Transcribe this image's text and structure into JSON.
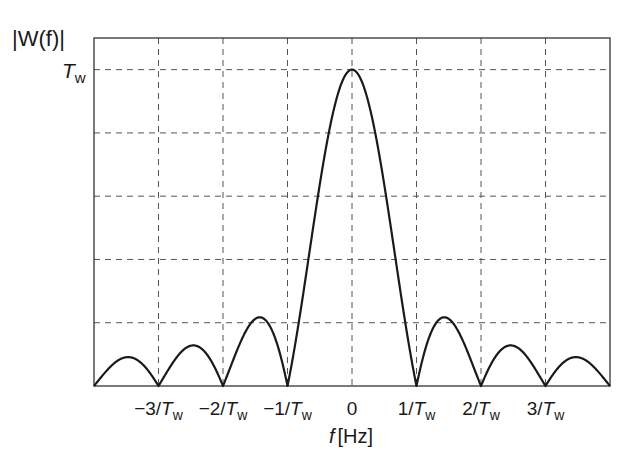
{
  "chart_data": {
    "type": "line",
    "title": "",
    "ylabel": "|W(f)|",
    "xlabel": "f [Hz]",
    "xlabel_var": "f",
    "xlabel_unit": "[Hz]",
    "x_unit": "1/T_w",
    "xlim": [
      -4,
      4
    ],
    "ylim": [
      0,
      1.1
    ],
    "y_unit": "T_w",
    "grid": true,
    "grid_style": "dashed",
    "x_ticks": [
      -3,
      -2,
      -1,
      0,
      1,
      2,
      3
    ],
    "x_tick_labels": [
      {
        "num": "−3/",
        "var": "T",
        "sub": "w"
      },
      {
        "num": "−2/",
        "var": "T",
        "sub": "w"
      },
      {
        "num": "−1/",
        "var": "T",
        "sub": "w"
      },
      {
        "num": "0",
        "var": "",
        "sub": ""
      },
      {
        "num": "1/",
        "var": "T",
        "sub": "w"
      },
      {
        "num": "2/",
        "var": "T",
        "sub": "w"
      },
      {
        "num": "3/",
        "var": "T",
        "sub": "w"
      }
    ],
    "y_ticks": [
      0.2,
      0.4,
      0.6,
      0.8,
      1.0
    ],
    "y_tick_labels": [
      {
        "value": 1.0,
        "var": "T",
        "sub": "w"
      }
    ],
    "series": [
      {
        "name": "|W(f)| = T_w |sinc(f T_w)|",
        "function": "abs_sinc",
        "peak": 1.0,
        "zeros": [
          -3,
          -2,
          -1,
          1,
          2,
          3
        ],
        "x": [
          -4,
          -3.5,
          -3,
          -2.5,
          -2,
          -1.5,
          -1,
          -0.5,
          0,
          0.5,
          1,
          1.5,
          2,
          2.5,
          3,
          3.5,
          4
        ],
        "values": [
          0,
          0.091,
          0,
          0.127,
          0,
          0.212,
          0,
          0.637,
          1.0,
          0.637,
          0,
          0.212,
          0,
          0.127,
          0,
          0.091,
          0
        ]
      }
    ],
    "colors": {
      "line": "#1a1a1a",
      "grid": "#555555",
      "axes": "#333333"
    }
  }
}
